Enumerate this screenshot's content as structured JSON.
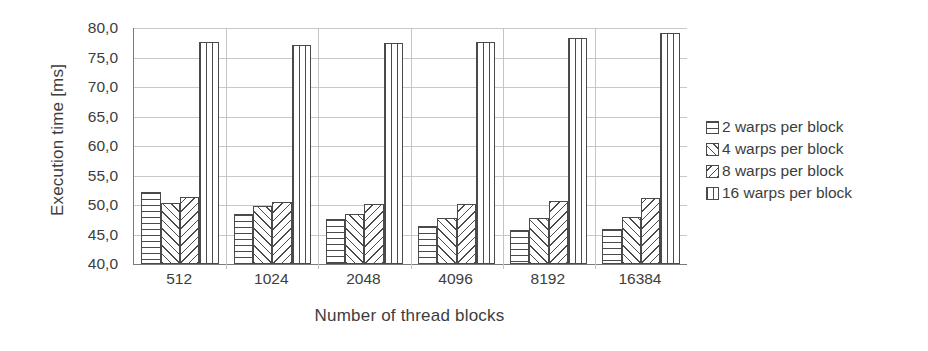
{
  "chart_data": {
    "type": "bar",
    "title": "",
    "xlabel": "Number of thread blocks",
    "ylabel": "Execution time [ms]",
    "categories": [
      "512",
      "1024",
      "2048",
      "4096",
      "8192",
      "16384"
    ],
    "ylim": [
      40.0,
      80.0
    ],
    "ytick_labels": [
      "80,0",
      "75,0",
      "70,0",
      "65,0",
      "60,0",
      "55,0",
      "50,0",
      "45,0",
      "40,0"
    ],
    "ytick_values": [
      80.0,
      75.0,
      70.0,
      65.0,
      60.0,
      55.0,
      50.0,
      45.0,
      40.0
    ],
    "grid": true,
    "legend_position": "right",
    "series": [
      {
        "name": "2 warps per block",
        "pattern": "horizontal-lines",
        "values": [
          52.2,
          48.5,
          47.6,
          46.5,
          45.8,
          46.0
        ]
      },
      {
        "name": "4 warps per block",
        "pattern": "diagonal-forward",
        "values": [
          50.4,
          49.8,
          48.5,
          47.8,
          47.8,
          48.0
        ]
      },
      {
        "name": "8 warps per block",
        "pattern": "diagonal-backward",
        "values": [
          51.4,
          50.5,
          50.2,
          50.2,
          50.6,
          51.2
        ]
      },
      {
        "name": "16 warps per block",
        "pattern": "vertical-lines",
        "values": [
          77.7,
          77.1,
          77.4,
          77.6,
          78.3,
          79.1
        ]
      }
    ]
  },
  "legend": {
    "items": [
      {
        "label": "2 warps per block"
      },
      {
        "label": "4 warps per block"
      },
      {
        "label": "8 warps per block"
      },
      {
        "label": "16 warps per block"
      }
    ]
  }
}
